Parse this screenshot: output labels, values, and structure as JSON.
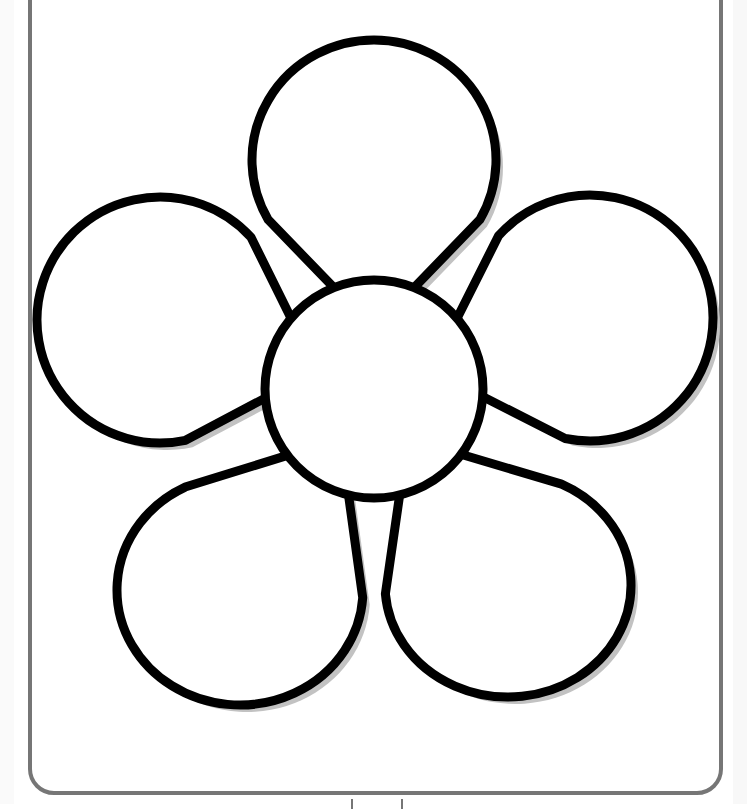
{
  "illustration": {
    "subject": "flower",
    "style": "coloring-page outline",
    "petal_count": 5,
    "petals": [
      {
        "name": "top",
        "cx": 374,
        "cy": 160,
        "rx": 122,
        "ry": 120
      },
      {
        "name": "left",
        "cx": 160,
        "cy": 320,
        "rx": 123,
        "ry": 123
      },
      {
        "name": "right",
        "cx": 590,
        "cy": 318,
        "rx": 123,
        "ry": 123
      },
      {
        "name": "bottom-left",
        "cx": 240,
        "cy": 590,
        "rx": 123,
        "ry": 115
      },
      {
        "name": "bottom-right",
        "cx": 508,
        "cy": 585,
        "rx": 123,
        "ry": 112
      }
    ],
    "center": {
      "cx": 374,
      "cy": 389,
      "r": 109
    },
    "colors": {
      "outline": "#000000",
      "fill": "#ffffff",
      "shadow": "#c2c2c2",
      "frame": "#767676",
      "background": "#ffffff"
    }
  }
}
